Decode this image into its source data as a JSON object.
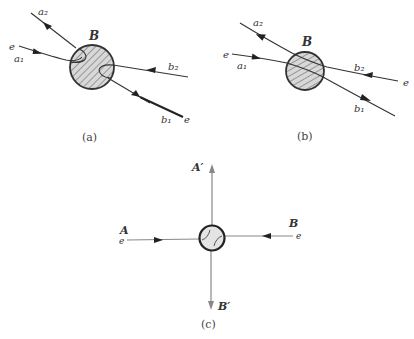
{
  "figure": {
    "panels": [
      {
        "id": "a",
        "caption": "(a)",
        "blob_label": "B",
        "labels": {
          "a2": "a₂",
          "a1": "a₁",
          "e_in": "e",
          "b2": "b₂",
          "b1": "b₁",
          "e_out": "e"
        }
      },
      {
        "id": "b",
        "caption": "(b)",
        "blob_label": "B",
        "labels": {
          "a2": "a₂",
          "a1": "a₁",
          "e_in": "e",
          "b2": "b₂",
          "b1": "b₁",
          "e_out": "e"
        }
      },
      {
        "id": "c",
        "caption": "(c)",
        "labels": {
          "A": "A",
          "A_prime": "A′",
          "B": "B",
          "B_prime": "B′",
          "e_left": "e",
          "e_right": "e"
        }
      }
    ],
    "colors": {
      "line": "#333333",
      "grey_line": "#888888",
      "blob_fill": "#d8d8d8",
      "hatch": "#555555"
    }
  }
}
